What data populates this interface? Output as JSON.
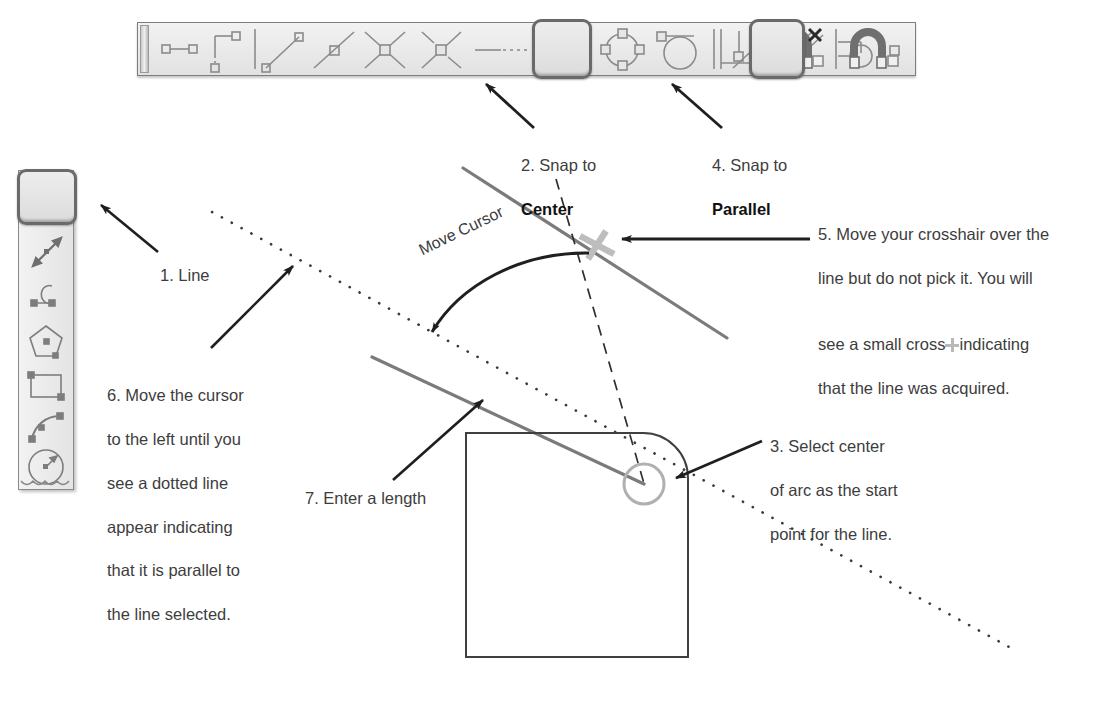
{
  "page": {
    "background_color": "#ffffff",
    "ink_color": "#3d3d3d",
    "geometry_color": "#6e6e6e",
    "highlight_color": "#bdbdbd"
  },
  "callouts": {
    "one": {
      "label": "1. Line"
    },
    "two": {
      "line1": "2. Snap to",
      "line2": "Center"
    },
    "three": {
      "line1": "3. Select center",
      "line2": "of arc as the start",
      "line3": "point for the line."
    },
    "four": {
      "line1": "4. Snap to",
      "line2": "Parallel"
    },
    "five": {
      "line1": "5. Move your crosshair over the",
      "line2": "line but do not pick it. You will",
      "line3a": "see a small cross",
      "line3b": "indicating",
      "line4": "that the line was acquired."
    },
    "six": {
      "line1": "6. Move the cursor",
      "line2": "to the left until you",
      "line3": "see a dotted line",
      "line4": "appear indicating",
      "line5": "that it is parallel to",
      "line6": "the line selected."
    },
    "seven": {
      "label": "7. Enter a length"
    },
    "move_cursor": {
      "label": "Move Cursor"
    }
  },
  "horizontal_toolbar": {
    "name": "Object Snap toolbar",
    "buttons": [
      {
        "id": "snap-from",
        "name": "snap-from-icon",
        "pressed": false
      },
      {
        "id": "snap-temporary-track-point",
        "name": "temporary-track-point-icon",
        "pressed": false
      },
      {
        "id": "snap-endpoint",
        "name": "snap-endpoint-icon",
        "pressed": false
      },
      {
        "id": "snap-midpoint",
        "name": "snap-midpoint-icon",
        "pressed": false
      },
      {
        "id": "snap-intersection",
        "name": "snap-intersection-icon",
        "pressed": false
      },
      {
        "id": "snap-apparent-intersection",
        "name": "snap-apparent-intersection-icon",
        "pressed": false
      },
      {
        "id": "snap-extension",
        "name": "snap-extension-icon",
        "pressed": false
      },
      {
        "id": "snap-center",
        "name": "snap-center-icon",
        "pressed": true
      },
      {
        "id": "snap-quadrant",
        "name": "snap-quadrant-icon",
        "pressed": false
      },
      {
        "id": "snap-tangent",
        "name": "snap-tangent-icon",
        "pressed": false
      },
      {
        "id": "snap-perpendicular",
        "name": "snap-perpendicular-icon",
        "pressed": false
      },
      {
        "id": "snap-parallel",
        "name": "snap-parallel-icon",
        "pressed": true
      },
      {
        "id": "snap-insert",
        "name": "snap-insert-icon",
        "pressed": false
      },
      {
        "id": "snap-node",
        "name": "snap-node-icon",
        "pressed": false
      },
      {
        "id": "snap-nearest",
        "name": "snap-nearest-icon",
        "pressed": false
      },
      {
        "id": "snap-none",
        "name": "snap-none-magnet-icon",
        "pressed": false
      },
      {
        "id": "osnap-settings",
        "name": "osnap-settings-magnet-icon",
        "pressed": false
      }
    ],
    "pressed_button_labels": [
      "Snap to Center",
      "Snap to Parallel"
    ]
  },
  "vertical_toolbar": {
    "name": "Draw toolbar",
    "buttons": [
      {
        "id": "draw-line",
        "name": "line-icon",
        "pressed": true
      },
      {
        "id": "draw-construction-line",
        "name": "construction-line-icon",
        "pressed": false
      },
      {
        "id": "draw-polyline",
        "name": "polyline-icon",
        "pressed": false
      },
      {
        "id": "draw-polygon",
        "name": "polygon-icon",
        "pressed": false
      },
      {
        "id": "draw-rectangle",
        "name": "rectangle-icon",
        "pressed": false
      },
      {
        "id": "draw-arc",
        "name": "arc-icon",
        "pressed": false
      },
      {
        "id": "draw-circle",
        "name": "circle-icon",
        "pressed": false
      }
    ]
  },
  "drawing": {
    "reference_line": {
      "name": "selected-reference-line"
    },
    "new_line": {
      "name": "new-line-being-drawn"
    },
    "parallel_tracking_line": {
      "name": "parallel-dotted-tracking-line"
    },
    "alignment_line": {
      "name": "center-alignment-dashed-line"
    },
    "shape": {
      "name": "rounded-rectangle-with-arc"
    },
    "arc_center_marker": {
      "name": "arc-center-circle-marker"
    },
    "acquired_marker": {
      "name": "parallel-acquired-cross-marker"
    }
  }
}
